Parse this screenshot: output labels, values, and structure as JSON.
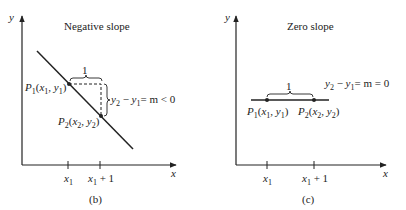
{
  "panel_b": {
    "title": "Negative slope",
    "y_axis_label": "y",
    "x_axis_label": "x",
    "run_label": "1",
    "p1_label": "P",
    "p1_sub": "1",
    "p1_coords": "(x1, y1)",
    "p2_label": "P",
    "p2_sub": "2",
    "p2_coords": "(x2, y2)",
    "rise_equation": "y2 − y1 = m < 0",
    "tick_x1": "x1",
    "tick_x1_plus_1": "x1 + 1",
    "caption": "(b)"
  },
  "panel_c": {
    "title": "Zero slope",
    "y_axis_label": "y",
    "x_axis_label": "x",
    "run_label": "1",
    "p1_label": "P",
    "p1_sub": "1",
    "p1_coords": "(x1, y1)",
    "p2_label": "P",
    "p2_sub": "2",
    "p2_coords": "(x2, y2)",
    "rise_equation": "y2 − y1 = m = 0",
    "tick_x1": "x1",
    "tick_x1_plus_1": "x1 + 1",
    "caption": "(c)"
  }
}
